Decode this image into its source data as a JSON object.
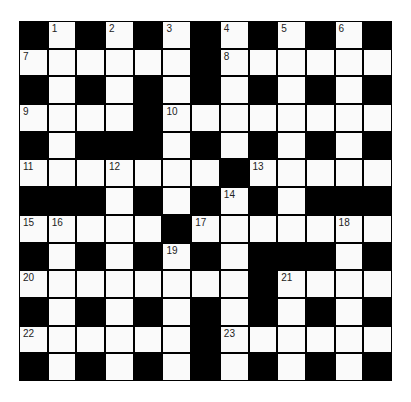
{
  "puzzle": {
    "rows": 13,
    "cols": 13,
    "colors": {
      "block": "#000000",
      "cell": "#fafafa",
      "number": "#222222"
    },
    "layout": [
      "#.#.#.#.#.#.#",
      "......#......",
      "#.#.#.#.#.#.#",
      "....#........",
      "#.###.#.#.#.#",
      ".......#.....",
      "###.#.#.#.###",
      ".....#.......",
      "#.#.#.#.###.#",
      "........#....",
      "#.#.#.#.#.#.#",
      "......#......",
      "#.#.#.#.#.#.#"
    ],
    "numbers": [
      {
        "row": 0,
        "col": 1,
        "n": "1"
      },
      {
        "row": 0,
        "col": 3,
        "n": "2"
      },
      {
        "row": 0,
        "col": 5,
        "n": "3"
      },
      {
        "row": 0,
        "col": 7,
        "n": "4"
      },
      {
        "row": 0,
        "col": 9,
        "n": "5"
      },
      {
        "row": 0,
        "col": 11,
        "n": "6"
      },
      {
        "row": 1,
        "col": 0,
        "n": "7"
      },
      {
        "row": 1,
        "col": 7,
        "n": "8"
      },
      {
        "row": 3,
        "col": 0,
        "n": "9"
      },
      {
        "row": 3,
        "col": 5,
        "n": "10"
      },
      {
        "row": 5,
        "col": 0,
        "n": "11"
      },
      {
        "row": 5,
        "col": 3,
        "n": "12"
      },
      {
        "row": 5,
        "col": 8,
        "n": "13"
      },
      {
        "row": 6,
        "col": 7,
        "n": "14"
      },
      {
        "row": 7,
        "col": 0,
        "n": "15"
      },
      {
        "row": 7,
        "col": 1,
        "n": "16"
      },
      {
        "row": 7,
        "col": 6,
        "n": "17"
      },
      {
        "row": 7,
        "col": 11,
        "n": "18"
      },
      {
        "row": 8,
        "col": 5,
        "n": "19"
      },
      {
        "row": 9,
        "col": 0,
        "n": "20"
      },
      {
        "row": 9,
        "col": 9,
        "n": "21"
      },
      {
        "row": 11,
        "col": 0,
        "n": "22"
      },
      {
        "row": 11,
        "col": 7,
        "n": "23"
      }
    ]
  }
}
